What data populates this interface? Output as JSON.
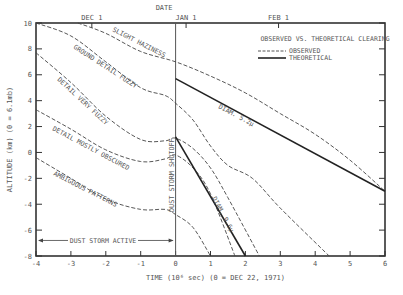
{
  "chart_data": {
    "type": "line",
    "title": "OBSERVED VS. THEORETICAL CLEARING",
    "top_axis_label": "DATE",
    "top_ticks": [
      {
        "label": "DEC 1",
        "x": -2.4
      },
      {
        "label": "JAN 1",
        "x": 0.3
      },
      {
        "label": "FEB 1",
        "x": 2.95
      }
    ],
    "xlabel": "TIME (10^6 sec) (0 = DEC 22, 1971)",
    "xlabel_display": "TIME (10⁶ sec) (0 = DEC 22, 1971)",
    "ylabel": "ALTITUDE (km) (0 = 6.1mb)",
    "xlim": [
      -4,
      6
    ],
    "ylim": [
      -8,
      10
    ],
    "xticks": [
      -4,
      -3,
      -2,
      -1,
      0,
      1,
      2,
      3,
      4,
      5,
      6
    ],
    "yticks": [
      -8,
      -6,
      -4,
      -2,
      0,
      2,
      4,
      6,
      8,
      10
    ],
    "legend": [
      {
        "label": "OBSERVED",
        "style": "dashed"
      },
      {
        "label": "THEORETICAL",
        "style": "solid"
      }
    ],
    "legend_position": "upper right",
    "grid": false,
    "annotations": [
      {
        "text": "DUST STORM SHUTOFF",
        "x": 0,
        "orientation": "vertical"
      },
      {
        "text": "DUST STORM ACTIVE",
        "x_range": [
          -4,
          0
        ],
        "y": -6.8
      },
      {
        "text": "SLIGHT HAZINESS"
      },
      {
        "text": "GROUND DETAIL FUZZY"
      },
      {
        "text": "DETAIL VERY FUZZY"
      },
      {
        "text": "DETAIL MOSTLY OBSCURED"
      },
      {
        "text": "AMBIGUOUS PATTERNS"
      },
      {
        "text": "DIAM. 5.2μ"
      },
      {
        "text": "DIAM. 9.6μ"
      }
    ],
    "series": [
      {
        "name": "SLIGHT HAZINESS (observed)",
        "style": "dashed",
        "x": [
          -2.8,
          -2,
          -1,
          0,
          1,
          2,
          3,
          4,
          5,
          6
        ],
        "y": [
          10,
          9.2,
          7.8,
          7.0,
          5.9,
          4.6,
          3.0,
          1.4,
          -0.6,
          -3.0
        ]
      },
      {
        "name": "GROUND DETAIL FUZZY (observed)",
        "style": "dashed",
        "x": [
          -4,
          -3,
          -2,
          -1,
          -0.3,
          0,
          0.5,
          1,
          1.5,
          2.2,
          3,
          4.4
        ],
        "y": [
          10,
          9.0,
          7.0,
          5.0,
          4.4,
          3.8,
          2.5,
          0.5,
          -1.0,
          -2.0,
          -4.3,
          -8.0
        ]
      },
      {
        "name": "DETAIL VERY FUZZY (observed)",
        "style": "dashed",
        "x": [
          -4,
          -3,
          -2,
          -1,
          -0.3,
          0,
          0.5,
          1,
          1.5,
          2.4
        ],
        "y": [
          7.7,
          5.4,
          2.8,
          1.0,
          0.9,
          1.1,
          0.3,
          -1.2,
          -3.5,
          -8.0
        ]
      },
      {
        "name": "DETAIL MOSTLY OBSCURED (observed)",
        "style": "dashed",
        "x": [
          -4,
          -3,
          -2,
          -1,
          -0.3,
          0,
          0.5,
          1,
          1.7
        ],
        "y": [
          3.3,
          1.8,
          0.2,
          -0.7,
          -0.5,
          -0.2,
          -1.2,
          -3.2,
          -8.0
        ]
      },
      {
        "name": "AMBIGUOUS PATTERNS (observed)",
        "style": "dashed",
        "x": [
          -4,
          -3,
          -2,
          -1,
          -0.3,
          0,
          0.5,
          1
        ],
        "y": [
          -0.4,
          -2.0,
          -3.6,
          -4.4,
          -4.4,
          -4.8,
          -5.8,
          -8.0
        ]
      },
      {
        "name": "DIAM. 5.2μ (theoretical)",
        "style": "solid",
        "x": [
          0,
          6
        ],
        "y": [
          5.7,
          -3.0
        ]
      },
      {
        "name": "DIAM. 9.6μ (theoretical)",
        "style": "solid",
        "x": [
          0,
          2
        ],
        "y": [
          1.2,
          -8.0
        ]
      }
    ]
  }
}
